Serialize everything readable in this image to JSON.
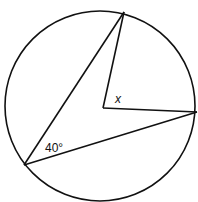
{
  "diagram": {
    "type": "circle-geometry",
    "circle": {
      "cx": 100,
      "cy": 106,
      "r": 95
    },
    "points": {
      "top": {
        "x": 124,
        "y": 12
      },
      "center": {
        "x": 103,
        "y": 108
      },
      "right": {
        "x": 197,
        "y": 112
      },
      "bottom_left": {
        "x": 24,
        "y": 165
      }
    },
    "labels": {
      "inscribed_angle": "40°",
      "central_angle": "x"
    },
    "colors": {
      "stroke": "#111111",
      "background": "#ffffff"
    }
  }
}
